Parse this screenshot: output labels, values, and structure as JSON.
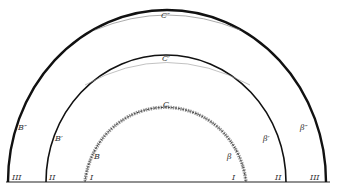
{
  "diagram": {
    "arcs": [
      {
        "name": "outer",
        "top_label": "C″",
        "left_label": "B″",
        "right_label": "β″",
        "base_left": "III",
        "base_right": "III"
      },
      {
        "name": "middle",
        "top_label": "C′",
        "left_label": "B′",
        "right_label": "β′",
        "base_left": "II",
        "base_right": "II"
      },
      {
        "name": "inner",
        "top_label": "C",
        "left_label": "B",
        "right_label": "β",
        "base_left": "I",
        "base_right": "I"
      }
    ],
    "colors": {
      "line": "#111111",
      "hatch": "#777777",
      "background": "#ffffff"
    }
  }
}
